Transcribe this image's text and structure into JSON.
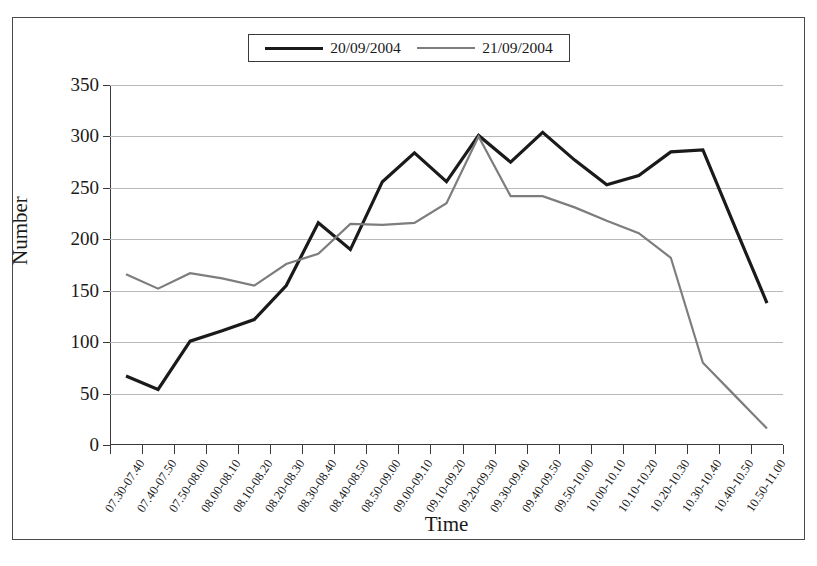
{
  "chart_data": {
    "type": "line",
    "title": "",
    "xlabel": "Time",
    "ylabel": "Number",
    "ylim": [
      0,
      350
    ],
    "yticks": [
      0,
      50,
      100,
      150,
      200,
      250,
      300,
      350
    ],
    "grid": true,
    "legend_position": "top-center",
    "categories": [
      "07.30-07.40",
      "07.40-07.50",
      "07.50-08.00",
      "08.00-08.10",
      "08.10-08.20",
      "08.20-08.30",
      "08.30-08.40",
      "08.40-08.50",
      "08.50-09.00",
      "09.00-09.10",
      "09.10-09.20",
      "09.20-09.30",
      "09.30-09.40",
      "09.40-09.50",
      "09.50-10.00",
      "10.00-10.10",
      "10.10-10.20",
      "10.20-10.30",
      "10.30-10.40",
      "10.40-10.50",
      "10.50-11.00"
    ],
    "series": [
      {
        "name": "20/09/2004",
        "color": "#1a1a1a",
        "width": 3.2,
        "values": [
          67,
          54,
          101,
          111,
          122,
          155,
          216,
          190,
          256,
          284,
          256,
          301,
          275,
          304,
          277,
          253,
          262,
          285,
          287,
          212,
          138
        ]
      },
      {
        "name": "21/09/2004",
        "color": "#7d7d7d",
        "width": 2.2,
        "values": [
          166,
          152,
          167,
          162,
          155,
          176,
          186,
          215,
          214,
          216,
          235,
          300,
          242,
          242,
          231,
          218,
          206,
          182,
          80,
          48,
          16
        ]
      }
    ]
  },
  "legend": {
    "entries": [
      {
        "label": "20/09/2004"
      },
      {
        "label": "21/09/2004"
      }
    ]
  },
  "axes": {
    "x_title": "Time",
    "y_title": "Number"
  }
}
